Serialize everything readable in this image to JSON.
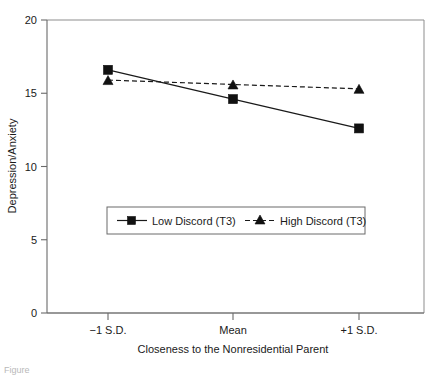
{
  "chart_data": {
    "type": "line",
    "title": "",
    "xlabel": "Closeness to the Nonresidential Parent",
    "ylabel": "Depression/Anxiety",
    "categories": [
      "−1 S.D.",
      "Mean",
      "+1 S.D."
    ],
    "xticklabels": [
      "−1 S.D.",
      "Mean",
      "+1 S.D."
    ],
    "yticklabels": [
      "0",
      "5",
      "10",
      "15",
      "20"
    ],
    "ytickvalues": [
      0,
      5,
      10,
      15,
      20
    ],
    "ylim": [
      0,
      20
    ],
    "grid": false,
    "legend_position": "center-left-inside",
    "series": [
      {
        "name": "Low Discord (T3)",
        "values": [
          16.6,
          14.6,
          12.6
        ],
        "marker": "square",
        "linestyle": "solid",
        "color": "#111111"
      },
      {
        "name": "High Discord (T3)",
        "values": [
          15.9,
          15.6,
          15.3
        ],
        "marker": "triangle",
        "linestyle": "dashed",
        "color": "#111111"
      }
    ]
  },
  "legend": {
    "entries": [
      {
        "label": "Low Discord (T3)"
      },
      {
        "label": "High Discord (T3)"
      }
    ]
  },
  "axes": {
    "y_title": "Depression/Anxiety",
    "x_title": "Closeness to the Nonresidential Parent",
    "y_tick_0": "0",
    "y_tick_5": "5",
    "y_tick_10": "10",
    "y_tick_15": "15",
    "y_tick_20": "20",
    "x_tick_1": "−1 S.D.",
    "x_tick_2": "Mean",
    "x_tick_3": "+1 S.D."
  },
  "caption": {
    "partial_text": "Figure"
  }
}
